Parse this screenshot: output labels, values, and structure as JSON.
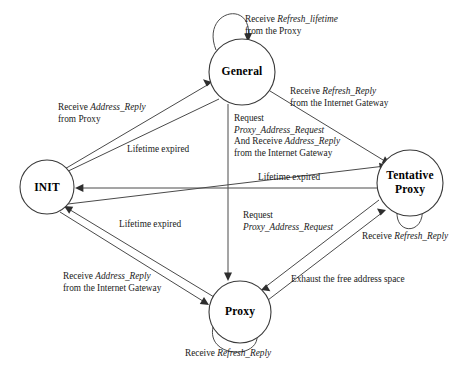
{
  "diagram": {
    "type": "state-machine",
    "background_color": "#ffffff",
    "line_color": "#4a4a4a",
    "text_color": "#1a1a1a"
  },
  "nodes": [
    {
      "id": "general",
      "label": "General",
      "label_line2": "",
      "cx": 242,
      "cy": 72,
      "r": 33
    },
    {
      "id": "init",
      "label": "INIT",
      "label_line2": "",
      "cx": 47,
      "cy": 187,
      "r": 27
    },
    {
      "id": "tentative_proxy",
      "label": "Tentative",
      "label_line2": "Proxy",
      "cx": 410,
      "cy": 183,
      "r": 33
    },
    {
      "id": "proxy",
      "label": "Proxy",
      "label_line2": "",
      "cx": 240,
      "cy": 312,
      "r": 31
    }
  ],
  "edges": [
    {
      "id": "general-self",
      "from": "general",
      "to": "general",
      "label_lines": [
        {
          "plain_before": "Receive ",
          "msg": "Refresh_lifetime",
          "plain_after": ""
        },
        {
          "plain_before": "from the Proxy",
          "msg": "",
          "plain_after": ""
        }
      ]
    },
    {
      "id": "general-to-tentative",
      "from": "general",
      "to": "tentative_proxy",
      "label_lines": [
        {
          "plain_before": "Receive ",
          "msg": "Refresh_Reply",
          "plain_after": ""
        },
        {
          "plain_before": "from the Internet Gateway",
          "msg": "",
          "plain_after": ""
        }
      ]
    },
    {
      "id": "init-to-general",
      "from": "init",
      "to": "general",
      "label_lines": [
        {
          "plain_before": "Receive ",
          "msg": "Address_Reply",
          "plain_after": ""
        },
        {
          "plain_before": "from Proxy",
          "msg": "",
          "plain_after": ""
        }
      ]
    },
    {
      "id": "general-to-init",
      "from": "general",
      "to": "init",
      "label_lines": [
        {
          "plain_before": "Lifetime expired",
          "msg": "",
          "plain_after": ""
        }
      ]
    },
    {
      "id": "general-to-proxy",
      "from": "general",
      "to": "proxy",
      "label_lines": [
        {
          "plain_before": "Request",
          "msg": "",
          "plain_after": ""
        },
        {
          "plain_before": "",
          "msg": "Proxy_Address_Request",
          "plain_after": ""
        },
        {
          "plain_before": "And Receive ",
          "msg": "Address_Reply",
          "plain_after": ""
        },
        {
          "plain_before": "from the Internet Gateway",
          "msg": "",
          "plain_after": ""
        }
      ]
    },
    {
      "id": "tentative-to-init",
      "from": "tentative_proxy",
      "to": "init",
      "label_lines": [
        {
          "plain_before": "Lifetime expired",
          "msg": "",
          "plain_after": ""
        }
      ]
    },
    {
      "id": "init-to-tentative",
      "from": "init",
      "to": "tentative_proxy",
      "label_lines": [
        {
          "plain_before": "Request",
          "msg": "",
          "plain_after": ""
        },
        {
          "plain_before": "",
          "msg": "Proxy_Address_Request",
          "plain_after": ""
        }
      ]
    },
    {
      "id": "tentative-self",
      "from": "tentative_proxy",
      "to": "tentative_proxy",
      "label_lines": [
        {
          "plain_before": "Receive ",
          "msg": "Refresh_Reply",
          "plain_after": ""
        }
      ]
    },
    {
      "id": "proxy-to-init",
      "from": "proxy",
      "to": "init",
      "label_lines": [
        {
          "plain_before": "Lifetime expired",
          "msg": "",
          "plain_after": ""
        }
      ]
    },
    {
      "id": "init-to-proxy",
      "from": "init",
      "to": "proxy",
      "label_lines": [
        {
          "plain_before": "Receive ",
          "msg": "Address_Reply",
          "plain_after": ""
        },
        {
          "plain_before": "from the Internet Gateway",
          "msg": "",
          "plain_after": ""
        }
      ]
    },
    {
      "id": "proxy-to-tentative",
      "from": "proxy",
      "to": "tentative_proxy",
      "label_lines": [
        {
          "plain_before": "Exhaust the free address space",
          "msg": "",
          "plain_after": ""
        }
      ]
    },
    {
      "id": "proxy-self",
      "from": "proxy",
      "to": "proxy",
      "label_lines": [
        {
          "plain_before": "Receive ",
          "msg": "Refresh_Reply",
          "plain_after": ""
        }
      ]
    }
  ],
  "labels": {
    "general_self_l1_pre": "Receive ",
    "general_self_l1_msg": "Refresh_lifetime",
    "general_self_l2": "from the Proxy",
    "gen_tent_l1_pre": "Receive ",
    "gen_tent_l1_msg": "Refresh_Reply",
    "gen_tent_l2": "from the Internet Gateway",
    "init_gen_l1_pre": "Receive ",
    "init_gen_l1_msg": "Address_Reply",
    "init_gen_l2": "from Proxy",
    "gen_init_l1": "Lifetime expired",
    "gen_proxy_l1": "Request",
    "gen_proxy_l2_msg": "Proxy_Address_Request",
    "gen_proxy_l3_pre": "And Receive ",
    "gen_proxy_l3_msg": "Address_Reply",
    "gen_proxy_l4": "from the Internet Gateway",
    "tent_init_l1": "Lifetime expired",
    "init_tent_l1": "Request",
    "init_tent_l2_msg": "Proxy_Address_Request",
    "tent_self_l1_pre": "Receive ",
    "tent_self_l1_msg": "Refresh_Reply",
    "proxy_init_l1": "Lifetime expired",
    "init_proxy_l1_pre": "Receive ",
    "init_proxy_l1_msg": "Address_Reply",
    "init_proxy_l2": "from the Internet Gateway",
    "proxy_tent_l1": "Exhaust the free address space",
    "proxy_self_l1_pre": "Receive ",
    "proxy_self_l1_msg": "Refresh_Reply"
  },
  "node_labels": {
    "general": "General",
    "init": "INIT",
    "tentative_line1": "Tentative",
    "tentative_line2": "Proxy",
    "proxy": "Proxy"
  }
}
